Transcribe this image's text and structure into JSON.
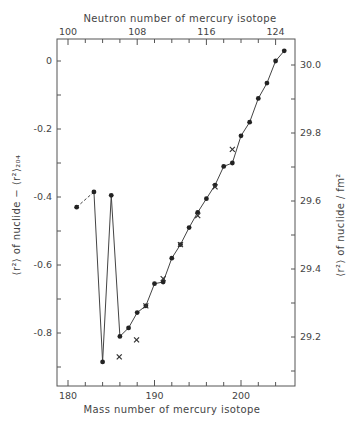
{
  "chart_data": {
    "type": "line",
    "title": "",
    "xlabel": "Mass number of mercury isotope",
    "x2label": "Neutron number of mercury isotope",
    "ylabel": "⟨r²⟩ of nuclide − ⟨r²⟩₂₀₄",
    "y2label": "⟨r²⟩ of nuclide / fm²",
    "xlim": [
      178,
      206.5
    ],
    "ylim": [
      -0.95,
      0.07
    ],
    "x_ticks": [
      180,
      190,
      200
    ],
    "x2_ticks": [
      100,
      108,
      116,
      124
    ],
    "y_ticks": [
      0,
      -0.2,
      -0.4,
      -0.6,
      -0.8
    ],
    "y_tick_labels": [
      "0",
      "-0.2",
      "-0.4",
      "-0.6",
      "-0.8"
    ],
    "y2_ticks": [
      30.0,
      29.8,
      29.6,
      29.4,
      29.2
    ],
    "y2_tick_labels": [
      "30.0",
      "29.8",
      "29.6",
      "29.4",
      "29.2"
    ],
    "grid": false,
    "series": [
      {
        "name": "measured (dots)",
        "marker": "dot",
        "x": [
          181,
          183,
          184,
          185,
          186,
          187,
          188,
          189,
          190,
          191,
          192,
          193,
          194,
          195,
          196,
          197,
          198,
          199,
          200,
          201,
          202,
          203,
          204,
          205
        ],
        "values": [
          -0.43,
          -0.385,
          -0.885,
          -0.395,
          -0.81,
          -0.785,
          -0.74,
          -0.72,
          -0.655,
          -0.65,
          -0.58,
          -0.54,
          -0.49,
          -0.445,
          -0.405,
          -0.365,
          -0.31,
          -0.3,
          -0.22,
          -0.18,
          -0.11,
          -0.065,
          0.0,
          0.03
        ],
        "dashed_segment": [
          181,
          183
        ]
      },
      {
        "name": "other measurements (crosses)",
        "marker": "x",
        "x": [
          185,
          187,
          189,
          191,
          193,
          195,
          197,
          199
        ],
        "values": [
          -0.87,
          -0.82,
          -0.72,
          -0.64,
          -0.54,
          -0.455,
          -0.37,
          -0.26
        ]
      }
    ]
  }
}
